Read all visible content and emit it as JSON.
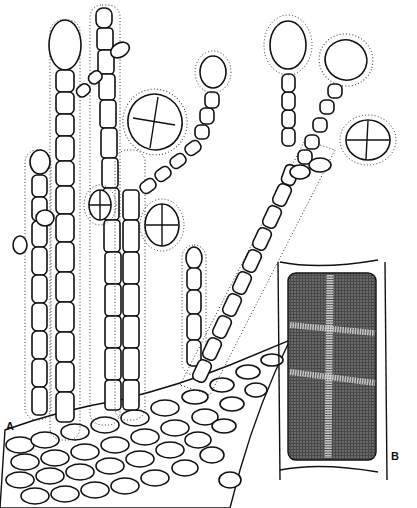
{
  "figure": {
    "panel_a": {
      "label": "A",
      "description": "Branched uniseriate filaments with terminal sporangia arising from a basal cell layer, surrounded by a dotted mucilage sheath"
    },
    "panel_b": {
      "label": "B",
      "description": "Enlarged single cell with stippled protoplast divided by a cruciate cleavage"
    }
  }
}
